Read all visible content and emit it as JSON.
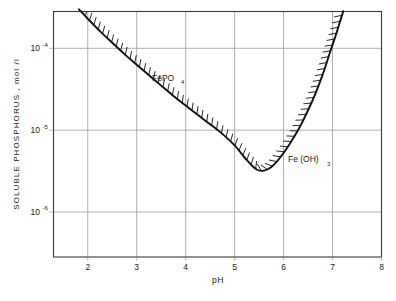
{
  "chart_data": {
    "type": "line",
    "title": "",
    "xlabel": "pH",
    "ylabel": "SOLUBLE  PHOSPHORUS , mol /l",
    "xlim": [
      1.3,
      8.0
    ],
    "ylim_log10": [
      -6.55,
      -3.55
    ],
    "yscale": "log",
    "grid": true,
    "legend_position": "inline-annotations",
    "x_ticks": [
      "2",
      "3",
      "4",
      "5",
      "6",
      "7",
      "8"
    ],
    "x_tick_values": [
      2,
      3,
      4,
      5,
      6,
      7,
      8
    ],
    "y_ticks": [
      {
        "mantissa": "10",
        "exponent": "-4",
        "value": 0.0001
      },
      {
        "mantissa": "10",
        "exponent": "-5",
        "value": 1e-05
      },
      {
        "mantissa": "10",
        "exponent": "-6",
        "value": 1e-06
      }
    ],
    "annotations": [
      {
        "name": "fepo4-label",
        "base": "FePO",
        "subscript": "4",
        "pH": 3.35,
        "value": 7e-05
      },
      {
        "name": "feoh3-label",
        "base": "Fe (OH)",
        "subscript": "3",
        "pH": 6.25,
        "value": 6.2e-06
      }
    ],
    "series": [
      {
        "name": "solubility-envelope",
        "label": "Soluble phosphorus solubility boundary",
        "hatched_side": "above",
        "points": [
          {
            "pH": 1.82,
            "value": 0.0003
          },
          {
            "pH": 2.0,
            "value": 0.00023
          },
          {
            "pH": 2.25,
            "value": 0.000162
          },
          {
            "pH": 2.5,
            "value": 0.000117
          },
          {
            "pH": 2.75,
            "value": 8.5e-05
          },
          {
            "pH": 3.0,
            "value": 6.3e-05
          },
          {
            "pH": 3.25,
            "value": 4.7e-05
          },
          {
            "pH": 3.5,
            "value": 3.5e-05
          },
          {
            "pH": 3.75,
            "value": 2.62e-05
          },
          {
            "pH": 4.0,
            "value": 2e-05
          },
          {
            "pH": 4.25,
            "value": 1.53e-05
          },
          {
            "pH": 4.5,
            "value": 1.18e-05
          },
          {
            "pH": 4.75,
            "value": 9e-06
          },
          {
            "pH": 5.0,
            "value": 6.5e-06
          },
          {
            "pH": 5.25,
            "value": 4.3e-06
          },
          {
            "pH": 5.45,
            "value": 3.3e-06
          },
          {
            "pH": 5.6,
            "value": 3.2e-06
          },
          {
            "pH": 5.75,
            "value": 3.55e-06
          },
          {
            "pH": 5.9,
            "value": 4.4e-06
          },
          {
            "pH": 6.05,
            "value": 5.8e-06
          },
          {
            "pH": 6.2,
            "value": 8e-06
          },
          {
            "pH": 6.35,
            "value": 1.15e-05
          },
          {
            "pH": 6.5,
            "value": 1.75e-05
          },
          {
            "pH": 6.65,
            "value": 2.8e-05
          },
          {
            "pH": 6.8,
            "value": 4.8e-05
          },
          {
            "pH": 6.95,
            "value": 9e-05
          },
          {
            "pH": 7.05,
            "value": 0.000135
          },
          {
            "pH": 7.15,
            "value": 0.00021
          },
          {
            "pH": 7.22,
            "value": 0.000285
          }
        ]
      }
    ]
  }
}
